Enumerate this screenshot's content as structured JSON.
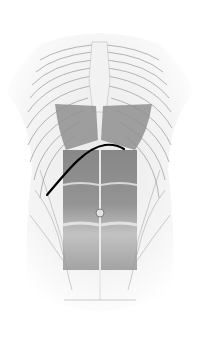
{
  "figure": {
    "subject": "Anterior torso anatomy illustration",
    "colors": {
      "background": "#ffffff",
      "bone": "#e6e6e6",
      "bone_outline": "#9a9a9a",
      "muscle_dark": "#6f6f6f",
      "muscle_mid": "#a0a0a0",
      "marker_line": "#000000"
    },
    "marker_line": {
      "start": [
        47,
        195
      ],
      "peak": [
        105,
        145
      ],
      "end": [
        124,
        149
      ]
    }
  }
}
